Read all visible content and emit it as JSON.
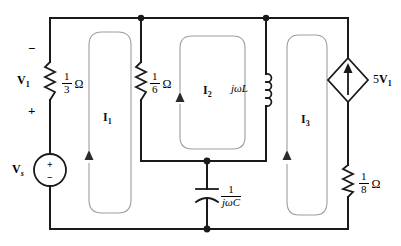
{
  "diagram": {
    "type": "electrical-circuit-schematic",
    "colors": {
      "wire": "#1a1a1a",
      "mesh_loop": "#9a9a9a",
      "background": "#ffffff"
    }
  },
  "components": {
    "source_vs": {
      "label": "V",
      "label_sub": "s",
      "plus": "+",
      "minus": "−",
      "symbol": "voltage-source-circle"
    },
    "resistor_left": {
      "numerator": "1",
      "denominator": "3",
      "unit": "Ω",
      "voltage_label": "V",
      "voltage_label_sub": "1",
      "polarity_top": "−",
      "polarity_bottom": "+",
      "symbol": "resistor-zigzag"
    },
    "resistor_middle": {
      "numerator": "1",
      "denominator": "6",
      "unit": "Ω",
      "symbol": "resistor-zigzag"
    },
    "inductor": {
      "label": "jωL",
      "symbol": "inductor-coil"
    },
    "capacitor": {
      "numerator": "1",
      "denominator": "jωC",
      "symbol": "capacitor-curved"
    },
    "dependent_source": {
      "label_gain": "5",
      "label_var": "V",
      "label_sub": "1",
      "symbol": "dependent-current-source-diamond",
      "arrow_direction": "up"
    },
    "resistor_right": {
      "numerator": "1",
      "denominator": "8",
      "unit": "Ω",
      "symbol": "resistor-zigzag"
    }
  },
  "meshes": [
    {
      "label": "I",
      "sub": "1",
      "direction": "counterclockwise"
    },
    {
      "label": "I",
      "sub": "2",
      "direction": "counterclockwise"
    },
    {
      "label": "I",
      "sub": "3",
      "direction": "counterclockwise"
    }
  ]
}
